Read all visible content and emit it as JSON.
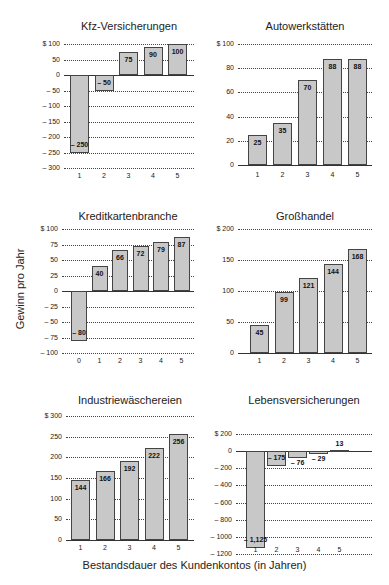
{
  "figure": {
    "y_axis_label": "Gewinn pro Jahr",
    "x_axis_label": "Bestandsdauer des Kundenkontos (in Jahren)"
  },
  "chart_data": [
    {
      "type": "bar",
      "title": "Kfz-Versicherungen",
      "categories": [
        "1",
        "2",
        "3",
        "4",
        "5"
      ],
      "values": [
        -250,
        -50,
        75,
        90,
        100
      ],
      "labels": [
        "– 250",
        "– 50",
        "75",
        "90",
        "100"
      ],
      "yticks": [
        100,
        50,
        0,
        -50,
        -100,
        -150,
        -200,
        -250,
        -300
      ],
      "ytick_labels": [
        "$ 100",
        "50",
        "0",
        "– 50",
        "– 100",
        "– 150",
        "– 200",
        "– 250",
        "– 300"
      ],
      "ylim": [
        -300,
        100
      ],
      "xlabel": "Bestandsdauer des Kundenkontos (in Jahren)",
      "ylabel": "Gewinn pro Jahr",
      "grid": true
    },
    {
      "type": "bar",
      "title": "Autowerkstätten",
      "categories": [
        "1",
        "2",
        "3",
        "4",
        "5"
      ],
      "values": [
        25,
        35,
        70,
        88,
        88
      ],
      "labels": [
        "25",
        "35",
        "70",
        "88",
        "88"
      ],
      "yticks": [
        100,
        80,
        60,
        40,
        20,
        0
      ],
      "ytick_labels": [
        "$ 100",
        "80",
        "60",
        "40",
        "20",
        "0"
      ],
      "ylim": [
        0,
        100
      ],
      "grid": true
    },
    {
      "type": "bar",
      "title": "Kreditkartenbranche",
      "categories": [
        "0",
        "1",
        "2",
        "3",
        "4",
        "5"
      ],
      "values": [
        -80,
        40,
        66,
        72,
        79,
        87
      ],
      "labels": [
        "– 80",
        "40",
        "66",
        "72",
        "79",
        "87"
      ],
      "yticks": [
        100,
        75,
        50,
        25,
        0,
        -25,
        -50,
        -75,
        -100
      ],
      "ytick_labels": [
        "$ 100",
        "75",
        "50",
        "25",
        "0",
        "– 25",
        "– 50",
        "– 75",
        "– 100"
      ],
      "ylim": [
        -100,
        100
      ],
      "grid": true
    },
    {
      "type": "bar",
      "title": "Großhandel",
      "categories": [
        "1",
        "2",
        "3",
        "4",
        "5"
      ],
      "values": [
        45,
        99,
        121,
        144,
        168
      ],
      "labels": [
        "45",
        "99",
        "121",
        "144",
        "168"
      ],
      "yticks": [
        200,
        150,
        100,
        50,
        0
      ],
      "ytick_labels": [
        "$ 200",
        "150",
        "100",
        "50",
        "0"
      ],
      "ylim": [
        0,
        200
      ],
      "grid": true
    },
    {
      "type": "bar",
      "title": "Industriewäschereien",
      "categories": [
        "1",
        "2",
        "3",
        "4",
        "5"
      ],
      "values": [
        144,
        166,
        192,
        222,
        256
      ],
      "labels": [
        "144",
        "166",
        "192",
        "222",
        "256"
      ],
      "yticks": [
        300,
        250,
        200,
        150,
        100,
        50,
        0
      ],
      "ytick_labels": [
        "$ 300",
        "250",
        "200",
        "150",
        "100",
        "50",
        "0"
      ],
      "ylim": [
        0,
        300
      ],
      "grid": true
    },
    {
      "type": "bar",
      "title": "Lebensversicherungen",
      "categories": [
        "1",
        "2",
        "3",
        "4",
        "5"
      ],
      "values": [
        -1125,
        -175,
        -76,
        -29,
        13,
        31
      ],
      "values_by_year": [
        -1125,
        -175,
        -76,
        -29,
        13,
        31
      ],
      "labels": [
        "– 1,125",
        "– 175",
        "– 76",
        "– 29",
        "13",
        "31"
      ],
      "yticks": [
        200,
        0,
        -200,
        -400,
        -600,
        -800,
        -1000,
        -1200
      ],
      "ytick_labels": [
        "$ 200",
        "0",
        "– 200",
        "– 400",
        "– 600",
        "– 800",
        "– 1000",
        "– 1200"
      ],
      "ylim": [
        -1200,
        200
      ],
      "grid": true
    }
  ],
  "panels": [
    {
      "title": "Kfz-Versicherungen"
    },
    {
      "title": "Autowerkstätten"
    },
    {
      "title": "Kreditkartenbranche"
    },
    {
      "title": "Großhandel"
    },
    {
      "title": "Industriewäschereien"
    },
    {
      "title": "Lebensversicherungen"
    }
  ]
}
